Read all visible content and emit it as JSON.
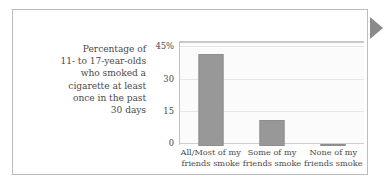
{
  "figure": {
    "marker_icon": "triangle-right-icon",
    "marker_color": "#8a8a8a",
    "border_color": "#bdbdbd",
    "background": "#ffffff"
  },
  "caption": {
    "lines": [
      "Percentage of",
      "11- to 17-year-olds",
      "who smoked a",
      "cigarette at least",
      "once in the past",
      "30 days"
    ],
    "text": "Percentage of 11- to 17-year-olds who smoked a cigarette at least once in the past 30 days"
  },
  "chart_data": {
    "type": "bar",
    "title": "",
    "subtitle": "",
    "xlabel": "",
    "ylabel": "Percentage of 11- to 17-year-olds who smoked a cigarette at least once in the past 30 days",
    "categories": [
      "All/Most of my friends smoke",
      "Some of my friends smoke",
      "None of my friends smoke"
    ],
    "category_lines": [
      [
        "All/Most of my",
        "friends smoke"
      ],
      [
        "Some of my",
        "friends smoke"
      ],
      [
        "None of my",
        "friends smoke"
      ]
    ],
    "values": [
      43,
      12,
      1
    ],
    "ylim": [
      0,
      48
    ],
    "yticks": [
      0,
      15,
      30,
      45
    ],
    "ytick_labels": [
      "0",
      "15",
      "30",
      "45%"
    ],
    "grid": true,
    "legend": "none",
    "bar_color": "#989898",
    "bar_edge_color": "#8e8e8e",
    "gridline_color": "#e6e6e6",
    "plot_background": "#fbfbfb",
    "axis_color": "#c2c2c2"
  }
}
